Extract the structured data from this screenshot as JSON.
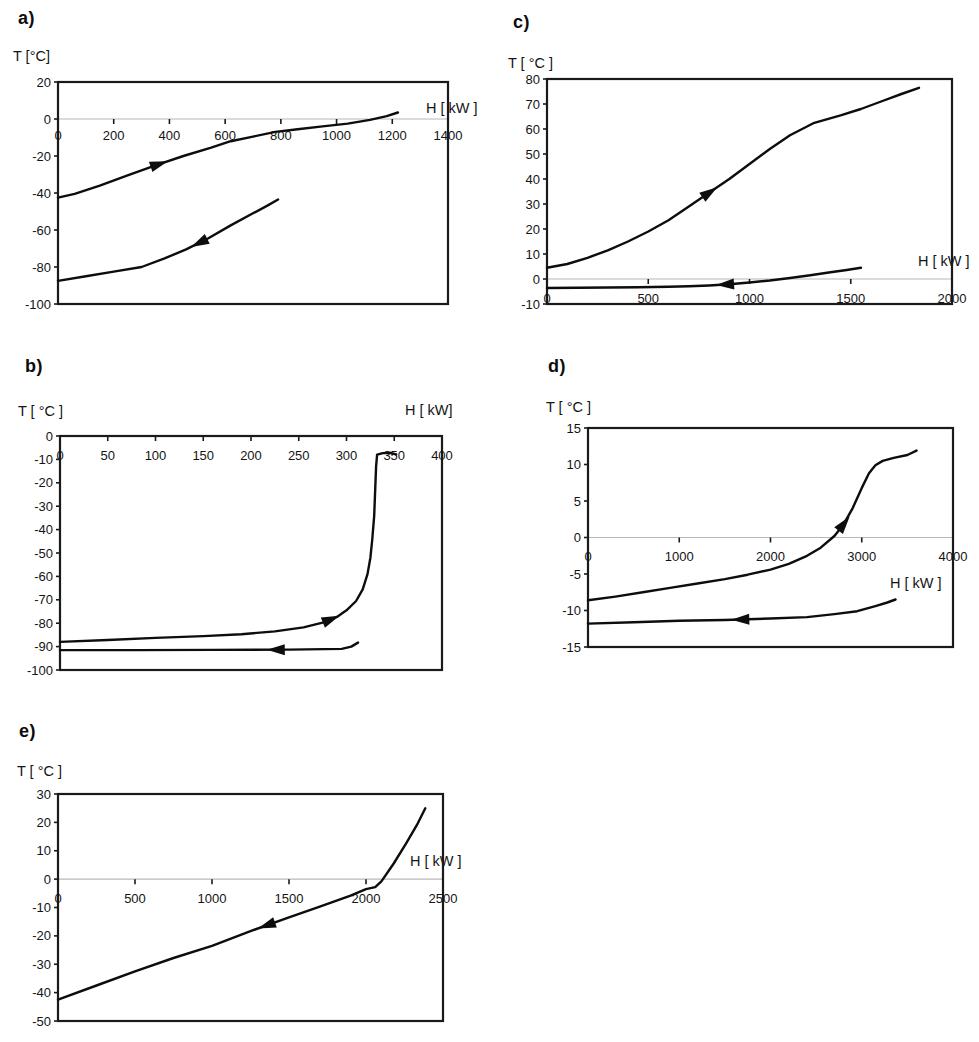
{
  "figure": {
    "curve_color": "#0d0d0d",
    "border_color": "#1a1a1a",
    "gridline_color": "#b8b8b8",
    "background": "#ffffff"
  },
  "chart_data": [
    {
      "id": "a",
      "type": "line",
      "letter": "a)",
      "y_title": "T [°C]",
      "x_title": "H [ kW ]",
      "zero_gridline": true,
      "x_axis": {
        "min": 0,
        "max": 1400,
        "ticks": [
          {
            "v": 0,
            "label": "0"
          },
          {
            "v": 200,
            "label": "200"
          },
          {
            "v": 400,
            "label": "400"
          },
          {
            "v": 600,
            "label": "600"
          },
          {
            "v": 800,
            "label": "800"
          },
          {
            "v": 1000,
            "label": "1000"
          },
          {
            "v": 1200,
            "label": "1200"
          },
          {
            "v": 1400,
            "label": "1400"
          }
        ]
      },
      "y_axis": {
        "min": -100,
        "max": 20,
        "ticks": [
          {
            "v": 20,
            "label": "20"
          },
          {
            "v": 0,
            "label": "0"
          },
          {
            "v": -20,
            "label": "-20"
          },
          {
            "v": -40,
            "label": "-40"
          },
          {
            "v": -60,
            "label": "-60"
          },
          {
            "v": -80,
            "label": "-80"
          },
          {
            "v": -100,
            "label": "-100"
          }
        ]
      },
      "series": [
        {
          "name": "heated stream",
          "direction": "forward",
          "arrow_at_h": 360,
          "points": [
            [
              0,
              -42.5
            ],
            [
              60,
              -40.5
            ],
            [
              150,
              -36
            ],
            [
              250,
              -30.5
            ],
            [
              350,
              -25
            ],
            [
              450,
              -20
            ],
            [
              550,
              -15.5
            ],
            [
              620,
              -12
            ],
            [
              700,
              -9.5
            ],
            [
              780,
              -7
            ],
            [
              860,
              -5.5
            ],
            [
              950,
              -4
            ],
            [
              1040,
              -2.5
            ],
            [
              1120,
              -0.5
            ],
            [
              1180,
              1.5
            ],
            [
              1220,
              3.5
            ]
          ]
        },
        {
          "name": "cooled stream",
          "direction": "backward",
          "arrow_at_h": 510,
          "points": [
            [
              0,
              -87.5
            ],
            [
              100,
              -85
            ],
            [
              200,
              -82.5
            ],
            [
              300,
              -80
            ],
            [
              380,
              -75.5
            ],
            [
              460,
              -70.5
            ],
            [
              540,
              -64.5
            ],
            [
              620,
              -57.5
            ],
            [
              700,
              -51
            ],
            [
              750,
              -47
            ],
            [
              790,
              -43.5
            ]
          ]
        }
      ]
    },
    {
      "id": "b",
      "type": "line",
      "letter": "b)",
      "y_title": "T [ °C ]",
      "x_title": "H [ kW]",
      "zero_gridline": false,
      "x_axis": {
        "min": 0,
        "max": 400,
        "ticks": [
          {
            "v": 0,
            "label": "0"
          },
          {
            "v": 50,
            "label": "50"
          },
          {
            "v": 100,
            "label": "100"
          },
          {
            "v": 150,
            "label": "150"
          },
          {
            "v": 200,
            "label": "200"
          },
          {
            "v": 250,
            "label": "250"
          },
          {
            "v": 300,
            "label": "300"
          },
          {
            "v": 350,
            "label": "350"
          },
          {
            "v": 400,
            "label": "400"
          }
        ]
      },
      "y_axis": {
        "min": -100,
        "max": 0,
        "ticks": [
          {
            "v": 0,
            "label": "0"
          },
          {
            "v": -10,
            "label": "-10"
          },
          {
            "v": -20,
            "label": "-20"
          },
          {
            "v": -30,
            "label": "-30"
          },
          {
            "v": -40,
            "label": "-40"
          },
          {
            "v": -50,
            "label": "-50"
          },
          {
            "v": -60,
            "label": "-60"
          },
          {
            "v": -70,
            "label": "-70"
          },
          {
            "v": -80,
            "label": "-80"
          },
          {
            "v": -90,
            "label": "-90"
          },
          {
            "v": -100,
            "label": "-100"
          }
        ]
      },
      "series": [
        {
          "name": "heated stream",
          "direction": "forward",
          "arrow_at_h": 283,
          "points": [
            [
              0,
              -88
            ],
            [
              50,
              -87.2
            ],
            [
              100,
              -86.3
            ],
            [
              150,
              -85.5
            ],
            [
              190,
              -84.7
            ],
            [
              225,
              -83.5
            ],
            [
              255,
              -81.8
            ],
            [
              275,
              -79.8
            ],
            [
              290,
              -77.3
            ],
            [
              300,
              -74.5
            ],
            [
              310,
              -70.5
            ],
            [
              317,
              -65.5
            ],
            [
              322,
              -59
            ],
            [
              325,
              -52
            ],
            [
              327,
              -44
            ],
            [
              329,
              -34
            ],
            [
              330,
              -24
            ],
            [
              331,
              -13
            ],
            [
              332,
              -8
            ],
            [
              338,
              -7.3
            ],
            [
              346,
              -7.2
            ],
            [
              352,
              -7.8
            ]
          ]
        },
        {
          "name": "cooled stream",
          "direction": "backward",
          "arrow_at_h": 227,
          "points": [
            [
              0,
              -91.5
            ],
            [
              80,
              -91.5
            ],
            [
              160,
              -91.4
            ],
            [
              240,
              -91.3
            ],
            [
              295,
              -91
            ],
            [
              305,
              -90
            ],
            [
              312,
              -88.3
            ]
          ]
        }
      ]
    },
    {
      "id": "c",
      "type": "line",
      "letter": "c)",
      "y_title": "T [ °C ]",
      "x_title": "H [ kW ]",
      "zero_gridline": true,
      "x_axis": {
        "min": 0,
        "max": 2000,
        "ticks": [
          {
            "v": 0,
            "label": "0"
          },
          {
            "v": 500,
            "label": "500"
          },
          {
            "v": 1000,
            "label": "1000"
          },
          {
            "v": 1500,
            "label": "1500"
          },
          {
            "v": 2000,
            "label": "2000"
          }
        ]
      },
      "y_axis": {
        "min": -10,
        "max": 80,
        "ticks": [
          {
            "v": 80,
            "label": "80"
          },
          {
            "v": 70,
            "label": "70"
          },
          {
            "v": 60,
            "label": "60"
          },
          {
            "v": 50,
            "label": "50"
          },
          {
            "v": 40,
            "label": "40"
          },
          {
            "v": 30,
            "label": "30"
          },
          {
            "v": 20,
            "label": "20"
          },
          {
            "v": 10,
            "label": "10"
          },
          {
            "v": 0,
            "label": "0"
          },
          {
            "v": -10,
            "label": "-10"
          }
        ]
      },
      "series": [
        {
          "name": "heated stream",
          "direction": "forward",
          "arrow_at_h": 800,
          "points": [
            [
              0,
              4.5
            ],
            [
              100,
              6
            ],
            [
              200,
              8.5
            ],
            [
              300,
              11.5
            ],
            [
              400,
              15
            ],
            [
              500,
              19
            ],
            [
              600,
              23.5
            ],
            [
              700,
              29
            ],
            [
              800,
              34.5
            ],
            [
              900,
              40
            ],
            [
              1000,
              46
            ],
            [
              1100,
              52
            ],
            [
              1200,
              57.5
            ],
            [
              1320,
              62.5
            ],
            [
              1450,
              65.5
            ],
            [
              1550,
              68
            ],
            [
              1650,
              71
            ],
            [
              1750,
              74
            ],
            [
              1837,
              76.5
            ]
          ]
        },
        {
          "name": "cooled stream",
          "direction": "backward",
          "arrow_at_h": 884,
          "points": [
            [
              0,
              -3.6
            ],
            [
              150,
              -3.5
            ],
            [
              300,
              -3.4
            ],
            [
              450,
              -3.3
            ],
            [
              600,
              -3.1
            ],
            [
              700,
              -2.9
            ],
            [
              800,
              -2.6
            ],
            [
              900,
              -2.1
            ],
            [
              1000,
              -1.4
            ],
            [
              1100,
              -0.6
            ],
            [
              1200,
              0.4
            ],
            [
              1300,
              1.5
            ],
            [
              1400,
              2.7
            ],
            [
              1480,
              3.6
            ],
            [
              1550,
              4.5
            ]
          ]
        }
      ]
    },
    {
      "id": "d",
      "type": "line",
      "letter": "d)",
      "y_title": "T [ °C ]",
      "x_title": "H [ kW ]",
      "zero_gridline": true,
      "x_axis": {
        "min": 0,
        "max": 4000,
        "ticks": [
          {
            "v": 0,
            "label": "0"
          },
          {
            "v": 1000,
            "label": "1000"
          },
          {
            "v": 2000,
            "label": "2000"
          },
          {
            "v": 3000,
            "label": "3000"
          },
          {
            "v": 4000,
            "label": "4000"
          }
        ]
      },
      "y_axis": {
        "min": -15,
        "max": 15,
        "ticks": [
          {
            "v": 15,
            "label": "15"
          },
          {
            "v": 10,
            "label": "10"
          },
          {
            "v": 5,
            "label": "5"
          },
          {
            "v": 0,
            "label": "0"
          },
          {
            "v": -5,
            "label": "-5"
          },
          {
            "v": -10,
            "label": "-10"
          },
          {
            "v": -15,
            "label": "-15"
          }
        ]
      },
      "series": [
        {
          "name": "heated stream",
          "direction": "forward",
          "arrow_at_h": 2800,
          "points": [
            [
              0,
              -8.6
            ],
            [
              300,
              -8.1
            ],
            [
              600,
              -7.5
            ],
            [
              900,
              -6.9
            ],
            [
              1200,
              -6.3
            ],
            [
              1500,
              -5.7
            ],
            [
              1750,
              -5.1
            ],
            [
              2000,
              -4.4
            ],
            [
              2200,
              -3.6
            ],
            [
              2400,
              -2.5
            ],
            [
              2550,
              -1.4
            ],
            [
              2700,
              0.2
            ],
            [
              2800,
              1.8
            ],
            [
              2900,
              4
            ],
            [
              3000,
              6.8
            ],
            [
              3080,
              8.8
            ],
            [
              3150,
              9.9
            ],
            [
              3230,
              10.5
            ],
            [
              3350,
              10.9
            ],
            [
              3500,
              11.3
            ],
            [
              3600,
              11.9
            ]
          ]
        },
        {
          "name": "cooled stream",
          "direction": "backward",
          "arrow_at_h": 1680,
          "points": [
            [
              0,
              -11.8
            ],
            [
              500,
              -11.6
            ],
            [
              1000,
              -11.4
            ],
            [
              1500,
              -11.3
            ],
            [
              2000,
              -11.1
            ],
            [
              2400,
              -10.9
            ],
            [
              2700,
              -10.5
            ],
            [
              2950,
              -10.1
            ],
            [
              3150,
              -9.4
            ],
            [
              3280,
              -8.9
            ],
            [
              3370,
              -8.5
            ]
          ]
        }
      ]
    },
    {
      "id": "e",
      "type": "line",
      "letter": "e)",
      "y_title": "T [ °C ]",
      "x_title": "H [ kW ]",
      "zero_gridline": true,
      "x_axis": {
        "min": 0,
        "max": 2500,
        "ticks": [
          {
            "v": 0,
            "label": "0"
          },
          {
            "v": 500,
            "label": "500"
          },
          {
            "v": 1000,
            "label": "1000"
          },
          {
            "v": 1500,
            "label": "1500"
          },
          {
            "v": 2000,
            "label": "2000"
          },
          {
            "v": 2500,
            "label": "2500"
          }
        ]
      },
      "y_axis": {
        "min": -50,
        "max": 30,
        "ticks": [
          {
            "v": 30,
            "label": "30"
          },
          {
            "v": 20,
            "label": "20"
          },
          {
            "v": 10,
            "label": "10"
          },
          {
            "v": 0,
            "label": "0"
          },
          {
            "v": -10,
            "label": "-10"
          },
          {
            "v": -20,
            "label": "-20"
          },
          {
            "v": -30,
            "label": "-30"
          },
          {
            "v": -40,
            "label": "-40"
          },
          {
            "v": -50,
            "label": "-50"
          }
        ]
      },
      "series": [
        {
          "name": "cooled stream",
          "direction": "backward",
          "arrow_at_h": 1360,
          "points": [
            [
              0,
              -42.5
            ],
            [
              250,
              -37.5
            ],
            [
              500,
              -32.5
            ],
            [
              750,
              -27.8
            ],
            [
              1000,
              -23.5
            ],
            [
              1250,
              -18.3
            ],
            [
              1500,
              -13.5
            ],
            [
              1700,
              -9.7
            ],
            [
              1900,
              -5.8
            ],
            [
              2000,
              -3.5
            ],
            [
              2060,
              -2.8
            ],
            [
              2100,
              -0.8
            ],
            [
              2180,
              5.5
            ],
            [
              2260,
              12.5
            ],
            [
              2330,
              19
            ],
            [
              2385,
              25
            ]
          ]
        }
      ]
    }
  ]
}
